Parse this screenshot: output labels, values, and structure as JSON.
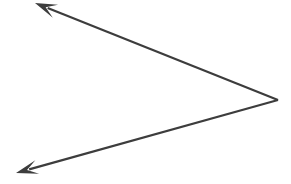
{
  "canvas": {
    "width": 291,
    "height": 184,
    "background_color": "#ffffff"
  },
  "figure": {
    "kind": "angle",
    "stroke_color": "#3d3d3d",
    "stroke_width": 2.2,
    "vertex": {
      "name": "vertex",
      "x": 278,
      "y": 100
    },
    "rays": [
      {
        "name": "upper-left-ray",
        "from_x": 278,
        "from_y": 100,
        "to_x": 35,
        "to_y": 3,
        "arrow_at": "end",
        "direction": "upper-left"
      },
      {
        "name": "lower-left-ray",
        "from_x": 278,
        "from_y": 100,
        "to_x": 16,
        "to_y": 173,
        "arrow_at": "end",
        "direction": "lower-left"
      }
    ],
    "arrowheads": [
      {
        "name": "upper-left-arrowhead",
        "tip_x": 35,
        "tip_y": 3,
        "style": "barbed",
        "length": 22,
        "half_width": 7
      },
      {
        "name": "lower-left-arrowhead",
        "tip_x": 16,
        "tip_y": 173,
        "style": "barbed",
        "length": 22,
        "half_width": 7
      }
    ],
    "labels": []
  }
}
